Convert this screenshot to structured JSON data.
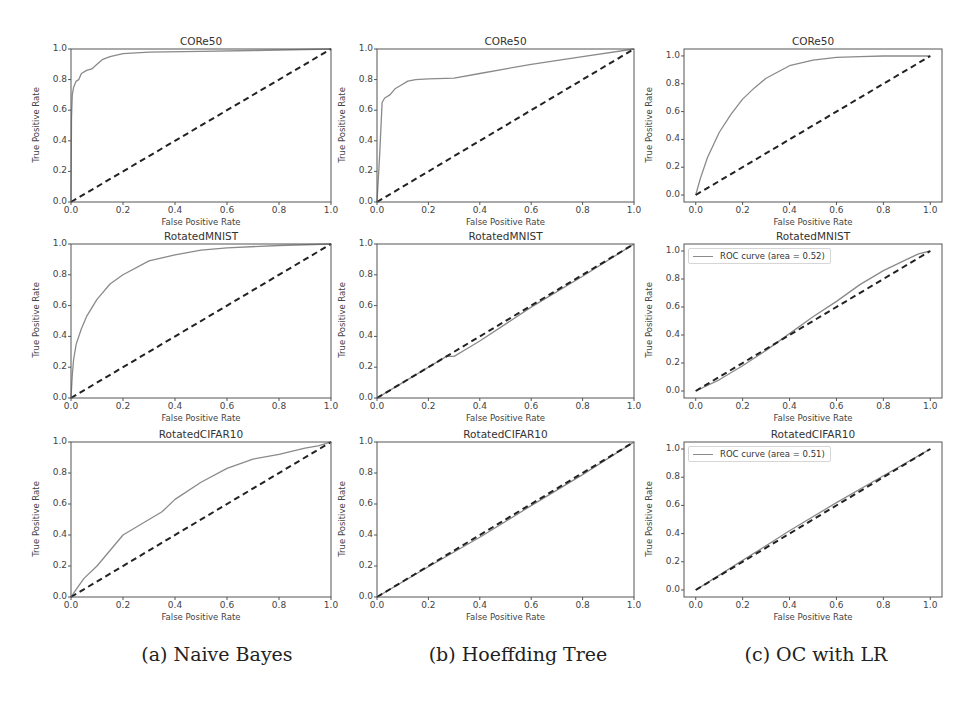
{
  "figure": {
    "captions": [
      "(a) Naive Bayes",
      "(b) Hoeffding Tree",
      "(c) OC with LR"
    ],
    "colors": {
      "roc_curve": "#8a8a8a",
      "diagonal": "#222222",
      "frame": "#555555"
    }
  },
  "chart_data": [
    {
      "type": "line",
      "column": "(a) Naive Bayes",
      "title": "CORe50",
      "xlabel": "False Positive Rate",
      "ylabel": "True Positive Rate",
      "xlim": [
        0,
        1
      ],
      "ylim": [
        0,
        1
      ],
      "xticks": [
        "0.0",
        "0.2",
        "0.4",
        "0.6",
        "0.8",
        "1.0"
      ],
      "yticks": [
        "0.0",
        "0.2",
        "0.4",
        "0.6",
        "0.8",
        "1.0"
      ],
      "legend": {
        "label": "ROC curve (area = 0.96)",
        "position": "lower right"
      },
      "series": [
        {
          "name": "ROC curve (area = 0.96)",
          "style": "solid",
          "x": [
            0,
            0.002,
            0.005,
            0.01,
            0.02,
            0.03,
            0.04,
            0.06,
            0.08,
            0.1,
            0.12,
            0.15,
            0.2,
            0.3,
            0.5,
            0.7,
            1.0
          ],
          "y": [
            0,
            0.55,
            0.7,
            0.75,
            0.79,
            0.8,
            0.84,
            0.86,
            0.87,
            0.9,
            0.93,
            0.95,
            0.97,
            0.98,
            0.985,
            0.99,
            1.0
          ]
        },
        {
          "name": "chance",
          "style": "dashed",
          "x": [
            0,
            1
          ],
          "y": [
            0,
            1
          ]
        }
      ]
    },
    {
      "type": "line",
      "column": "(b) Hoeffding Tree",
      "title": "CORe50",
      "xlabel": "False Positive Rate",
      "ylabel": "True Positive Rate",
      "xlim": [
        0,
        1
      ],
      "ylim": [
        0,
        1
      ],
      "xticks": [
        "0.0",
        "0.2",
        "0.4",
        "0.6",
        "0.8",
        "1.0"
      ],
      "yticks": [
        "0.0",
        "0.2",
        "0.4",
        "0.6",
        "0.8",
        "1.0"
      ],
      "legend": {
        "label": "ROC curve (area = 0.86)",
        "position": "lower right"
      },
      "series": [
        {
          "name": "ROC curve (area = 0.86)",
          "style": "solid",
          "x": [
            0,
            0.01,
            0.02,
            0.03,
            0.05,
            0.07,
            0.09,
            0.12,
            0.15,
            0.2,
            0.3,
            0.4,
            0.6,
            0.8,
            1.0
          ],
          "y": [
            0,
            0.3,
            0.65,
            0.68,
            0.7,
            0.74,
            0.76,
            0.79,
            0.8,
            0.805,
            0.81,
            0.84,
            0.9,
            0.95,
            1.0
          ]
        },
        {
          "name": "chance",
          "style": "dashed",
          "x": [
            0,
            1
          ],
          "y": [
            0,
            1
          ]
        }
      ]
    },
    {
      "type": "line",
      "column": "(c) OC with LR",
      "title": "CORe50",
      "xlabel": "False Positive Rate",
      "ylabel": "True Positive Rate",
      "xlim": [
        -0.05,
        1.05
      ],
      "ylim": [
        -0.05,
        1.05
      ],
      "xticks": [
        "0.0",
        "0.2",
        "0.4",
        "0.6",
        "0.8",
        "1.0"
      ],
      "yticks": [
        "0.0",
        "0.2",
        "0.4",
        "0.6",
        "0.8",
        "1.0"
      ],
      "legend": {
        "label": "ROC curve (area = 0.85)",
        "position": "lower right"
      },
      "series": [
        {
          "name": "ROC curve (area = 0.85)",
          "style": "solid",
          "x": [
            0,
            0.02,
            0.05,
            0.1,
            0.15,
            0.2,
            0.25,
            0.3,
            0.4,
            0.5,
            0.6,
            0.7,
            0.8,
            1.0
          ],
          "y": [
            0,
            0.12,
            0.27,
            0.45,
            0.58,
            0.69,
            0.77,
            0.84,
            0.93,
            0.97,
            0.99,
            0.995,
            1.0,
            1.0
          ]
        },
        {
          "name": "chance",
          "style": "dashed",
          "x": [
            0,
            1
          ],
          "y": [
            0,
            1
          ]
        }
      ]
    },
    {
      "type": "line",
      "column": "(a) Naive Bayes",
      "title": "RotatedMNIST",
      "xlabel": "False Positive Rate",
      "ylabel": "True Positive Rate",
      "xlim": [
        0,
        1
      ],
      "ylim": [
        0,
        1
      ],
      "xticks": [
        "0.0",
        "0.2",
        "0.4",
        "0.6",
        "0.8",
        "1.0"
      ],
      "yticks": [
        "0.0",
        "0.2",
        "0.4",
        "0.6",
        "0.8",
        "1.0"
      ],
      "legend": {
        "label": "ROC curve (area = 0.88)",
        "position": "lower right"
      },
      "series": [
        {
          "name": "ROC curve (area = 0.88)",
          "style": "solid",
          "x": [
            0,
            0.005,
            0.01,
            0.02,
            0.04,
            0.06,
            0.1,
            0.15,
            0.2,
            0.3,
            0.4,
            0.5,
            0.6,
            0.8,
            1.0
          ],
          "y": [
            0,
            0.15,
            0.25,
            0.35,
            0.45,
            0.53,
            0.64,
            0.74,
            0.8,
            0.89,
            0.93,
            0.96,
            0.975,
            0.99,
            1.0
          ]
        },
        {
          "name": "chance",
          "style": "dashed",
          "x": [
            0,
            1
          ],
          "y": [
            0,
            1
          ]
        }
      ]
    },
    {
      "type": "line",
      "column": "(b) Hoeffding Tree",
      "title": "RotatedMNIST",
      "xlabel": "False Positive Rate",
      "ylabel": "True Positive Rate",
      "xlim": [
        0,
        1
      ],
      "ylim": [
        0,
        1
      ],
      "xticks": [
        "0.0",
        "0.2",
        "0.4",
        "0.6",
        "0.8",
        "1.0"
      ],
      "yticks": [
        "0.0",
        "0.2",
        "0.4",
        "0.6",
        "0.8",
        "1.0"
      ],
      "legend": {
        "label": "ROC curve (area = 0.49)",
        "position": "lower right"
      },
      "series": [
        {
          "name": "ROC curve (area = 0.49)",
          "style": "solid",
          "x": [
            0,
            0.1,
            0.2,
            0.27,
            0.3,
            0.35,
            0.4,
            0.5,
            0.6,
            0.8,
            1.0
          ],
          "y": [
            0,
            0.1,
            0.2,
            0.27,
            0.27,
            0.32,
            0.37,
            0.48,
            0.59,
            0.79,
            1.0
          ]
        },
        {
          "name": "chance",
          "style": "dashed",
          "x": [
            0,
            1
          ],
          "y": [
            0,
            1
          ]
        }
      ]
    },
    {
      "type": "line",
      "column": "(c) OC with LR",
      "title": "RotatedMNIST",
      "xlabel": "False Positive Rate",
      "ylabel": "True Positive Rate",
      "xlim": [
        -0.05,
        1.05
      ],
      "ylim": [
        -0.05,
        1.05
      ],
      "xticks": [
        "0.0",
        "0.2",
        "0.4",
        "0.6",
        "0.8",
        "1.0"
      ],
      "yticks": [
        "0.0",
        "0.2",
        "0.4",
        "0.6",
        "0.8",
        "1.0"
      ],
      "legend": {
        "label": "ROC curve (area = 0.52)",
        "position": "upper left"
      },
      "series": [
        {
          "name": "ROC curve (area = 0.52)",
          "style": "solid",
          "x": [
            0,
            0.1,
            0.2,
            0.3,
            0.4,
            0.5,
            0.6,
            0.7,
            0.8,
            0.9,
            0.95,
            1.0
          ],
          "y": [
            0,
            0.08,
            0.18,
            0.29,
            0.41,
            0.53,
            0.64,
            0.76,
            0.86,
            0.94,
            0.98,
            1.0
          ]
        },
        {
          "name": "chance",
          "style": "dashed",
          "x": [
            0,
            1
          ],
          "y": [
            0,
            1
          ]
        }
      ]
    },
    {
      "type": "line",
      "column": "(a) Naive Bayes",
      "title": "RotatedCIFAR10",
      "xlabel": "False Positive Rate",
      "ylabel": "True Positive Rate",
      "xlim": [
        0,
        1
      ],
      "ylim": [
        0,
        1
      ],
      "xticks": [
        "0.0",
        "0.2",
        "0.4",
        "0.6",
        "0.8",
        "1.0"
      ],
      "yticks": [
        "0.0",
        "0.2",
        "0.4",
        "0.6",
        "0.8",
        "1.0"
      ],
      "legend": {
        "label": "ROC curve (area = 0.66)",
        "position": "lower right"
      },
      "series": [
        {
          "name": "ROC curve (area = 0.66)",
          "style": "solid",
          "x": [
            0,
            0.02,
            0.05,
            0.1,
            0.15,
            0.2,
            0.25,
            0.3,
            0.35,
            0.4,
            0.5,
            0.6,
            0.7,
            0.8,
            0.9,
            0.95,
            1.0
          ],
          "y": [
            0,
            0.05,
            0.12,
            0.2,
            0.3,
            0.4,
            0.45,
            0.5,
            0.55,
            0.63,
            0.74,
            0.83,
            0.89,
            0.92,
            0.96,
            0.975,
            1.0
          ]
        },
        {
          "name": "chance",
          "style": "dashed",
          "x": [
            0,
            1
          ],
          "y": [
            0,
            1
          ]
        }
      ]
    },
    {
      "type": "line",
      "column": "(b) Hoeffding Tree",
      "title": "RotatedCIFAR10",
      "xlabel": "False Positive Rate",
      "ylabel": "True Positive Rate",
      "xlim": [
        0,
        1
      ],
      "ylim": [
        0,
        1
      ],
      "xticks": [
        "0.0",
        "0.2",
        "0.4",
        "0.6",
        "0.8",
        "1.0"
      ],
      "yticks": [
        "0.0",
        "0.2",
        "0.4",
        "0.6",
        "0.8",
        "1.0"
      ],
      "legend": {
        "label": "ROC curve (area = 0.49)",
        "position": "lower right"
      },
      "series": [
        {
          "name": "ROC curve (area = 0.49)",
          "style": "solid",
          "x": [
            0,
            0.2,
            0.4,
            0.6,
            0.8,
            1.0
          ],
          "y": [
            0,
            0.195,
            0.385,
            0.59,
            0.79,
            1.0
          ]
        },
        {
          "name": "chance",
          "style": "dashed",
          "x": [
            0,
            1
          ],
          "y": [
            0,
            1
          ]
        }
      ]
    },
    {
      "type": "line",
      "column": "(c) OC with LR",
      "title": "RotatedCIFAR10",
      "xlabel": "False Positive Rate",
      "ylabel": "True Positive Rate",
      "xlim": [
        -0.05,
        1.05
      ],
      "ylim": [
        -0.05,
        1.05
      ],
      "xticks": [
        "0.0",
        "0.2",
        "0.4",
        "0.6",
        "0.8",
        "1.0"
      ],
      "yticks": [
        "0.0",
        "0.2",
        "0.4",
        "0.6",
        "0.8",
        "1.0"
      ],
      "legend": {
        "label": "ROC curve (area = 0.51)",
        "position": "upper left"
      },
      "series": [
        {
          "name": "ROC curve (area = 0.51)",
          "style": "solid",
          "x": [
            0,
            0.2,
            0.4,
            0.6,
            0.8,
            1.0
          ],
          "y": [
            0,
            0.21,
            0.42,
            0.62,
            0.81,
            1.0
          ]
        },
        {
          "name": "chance",
          "style": "dashed",
          "x": [
            0,
            1
          ],
          "y": [
            0,
            1
          ]
        }
      ]
    }
  ]
}
